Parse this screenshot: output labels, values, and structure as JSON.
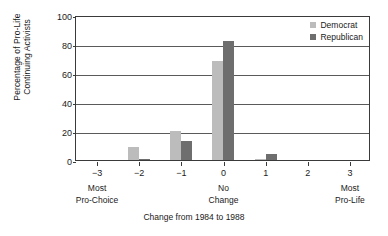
{
  "chart_data": {
    "type": "bar",
    "title": "",
    "xlabel": "Change from 1984 to 1988",
    "ylabel": "Percentage of Pro-Life\nContinuing Activists",
    "categories": [
      "-3",
      "-2",
      "-1",
      "0",
      "1",
      "2",
      "3"
    ],
    "category_sublabels": {
      "-3": "Most\nPro-Choice",
      "0": "No\nChange",
      "3": "Most\nPro-Life"
    },
    "series": [
      {
        "name": "Democrat",
        "color": "#bcbcbc",
        "values": [
          0,
          9,
          20,
          68,
          1,
          0,
          0
        ]
      },
      {
        "name": "Republican",
        "color": "#6e6e6e",
        "values": [
          0,
          1,
          13,
          82,
          4,
          0,
          0
        ]
      }
    ],
    "ylim": [
      0,
      100
    ],
    "yticks": [
      "0",
      "20",
      "40",
      "60",
      "80",
      "100"
    ],
    "grid": true,
    "legend_position": "top-right"
  },
  "legend": {
    "items": [
      {
        "label": "Democrat"
      },
      {
        "label": "Republican"
      }
    ]
  },
  "axes": {
    "y_title": "Percentage of Pro-Life\nContinuing Activists",
    "x_title": "Change from 1984 to 1988"
  }
}
